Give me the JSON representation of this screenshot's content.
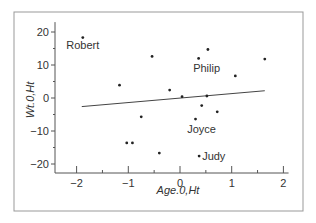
{
  "chart_data": {
    "type": "scatter",
    "title": "",
    "xlabel": "Age.0,Ht",
    "ylabel": "Wt.0,Ht",
    "xlim": [
      -2.1,
      2.1
    ],
    "ylim": [
      -21,
      23
    ],
    "xticks": [
      -2,
      -1,
      0,
      1,
      2
    ],
    "yticks": [
      20,
      10,
      0,
      -10,
      -20
    ],
    "grid": false,
    "legend": null,
    "points": [
      {
        "x": -1.88,
        "y": 18.3,
        "label": "Robert"
      },
      {
        "x": -1.17,
        "y": 3.9,
        "label": ""
      },
      {
        "x": -1.03,
        "y": -13.6,
        "label": ""
      },
      {
        "x": -0.92,
        "y": -13.6,
        "label": ""
      },
      {
        "x": -0.75,
        "y": -5.7,
        "label": ""
      },
      {
        "x": -0.54,
        "y": 12.6,
        "label": ""
      },
      {
        "x": -0.4,
        "y": -16.7,
        "label": ""
      },
      {
        "x": -0.2,
        "y": 2.4,
        "label": ""
      },
      {
        "x": 0.04,
        "y": 0.4,
        "label": ""
      },
      {
        "x": 0.3,
        "y": -6.4,
        "label": "Joyce"
      },
      {
        "x": 0.36,
        "y": 12.0,
        "label": "Philip"
      },
      {
        "x": 0.37,
        "y": -17.6,
        "label": "Judy"
      },
      {
        "x": 0.42,
        "y": -2.3,
        "label": ""
      },
      {
        "x": 0.52,
        "y": 0.6,
        "label": ""
      },
      {
        "x": 0.54,
        "y": 14.7,
        "label": ""
      },
      {
        "x": 0.72,
        "y": -4.2,
        "label": ""
      },
      {
        "x": 1.07,
        "y": 6.7,
        "label": ""
      },
      {
        "x": 1.64,
        "y": 11.8,
        "label": ""
      }
    ],
    "fit_line": {
      "x1": -1.9,
      "y1": -2.6,
      "x2": 1.64,
      "y2": 2.2
    }
  }
}
